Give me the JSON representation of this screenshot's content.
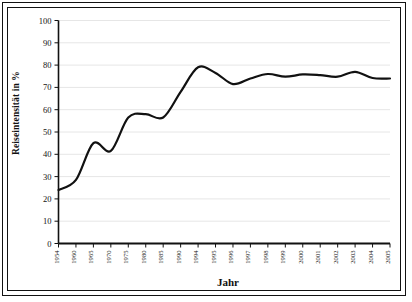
{
  "figure": {
    "background_color": "#ffffff",
    "frame_color": "#111111"
  },
  "chart_data": {
    "type": "line",
    "title": "",
    "subtitle": "",
    "xlabel": "Jahr",
    "ylabel": "Reiseintensität in %",
    "xlim": [
      0,
      20
    ],
    "ylim": [
      0,
      100
    ],
    "grid": true,
    "grid_axis": "y",
    "grid_color": "#e6e6e6",
    "legend": false,
    "legend_position": "none",
    "line_color": "#111111",
    "line_width": 2.2,
    "markers": false,
    "categories": [
      "1954",
      "1960",
      "1965",
      "1970",
      "1975",
      "1980",
      "1985",
      "1990",
      "1994",
      "1995",
      "1996",
      "1997",
      "1998",
      "1999",
      "2000",
      "2001",
      "2002",
      "2003",
      "2004",
      "2005"
    ],
    "xtick_labels": [
      "1954",
      "1960",
      "1965",
      "1970",
      "1975",
      "1980",
      "1985",
      "1990",
      "1994",
      "1995",
      "1996",
      "1997",
      "1998",
      "1999",
      "2000",
      "2001",
      "2002",
      "2003",
      "2004",
      "2005"
    ],
    "ytick_labels": [
      "0",
      "10",
      "20",
      "30",
      "40",
      "50",
      "60",
      "70",
      "80",
      "90",
      "100"
    ],
    "yticks": [
      0,
      10,
      20,
      30,
      40,
      50,
      60,
      70,
      80,
      90,
      100
    ],
    "series": [
      {
        "name": "Reiseintensität",
        "values": [
          24.0,
          28.5,
          45.0,
          41.5,
          56.5,
          58.0,
          56.5,
          68.0,
          79.0,
          76.5,
          71.5,
          74.0,
          76.0,
          74.8,
          75.8,
          75.5,
          74.8,
          77.0,
          74.2,
          74.0
        ]
      }
    ],
    "annotations": []
  }
}
